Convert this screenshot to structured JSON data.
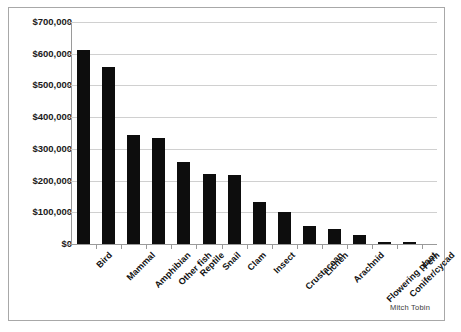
{
  "credit": "Mitch Tobin",
  "chart_data": {
    "type": "bar",
    "title": "",
    "xlabel": "",
    "ylabel": "",
    "categories": [
      "Bird",
      "Mammal",
      "Amphibian",
      "Other fish",
      "Reptile",
      "Snail",
      "Clam",
      "Insect",
      "Crustacean",
      "Lichen",
      "Arachnid",
      "Flowering plant",
      "Conifer/cycad",
      "Fern"
    ],
    "values": [
      613000,
      557000,
      345000,
      335000,
      258000,
      222000,
      218000,
      133000,
      102000,
      58000,
      48000,
      30000,
      8000,
      7000
    ],
    "ylim": [
      0,
      700000
    ],
    "ytick_values": [
      0,
      100000,
      200000,
      300000,
      400000,
      500000,
      600000,
      700000
    ],
    "ytick_labels": [
      "$0",
      "$100,000",
      "$200,000",
      "$300,000",
      "$400,000",
      "$500,000",
      "$600,000",
      "$700,000"
    ],
    "grid": true,
    "legend": "none",
    "bar_color": "#0d0d0d",
    "gridline_color": "#d0d0d0",
    "axis_color": "#9a9a9a"
  }
}
